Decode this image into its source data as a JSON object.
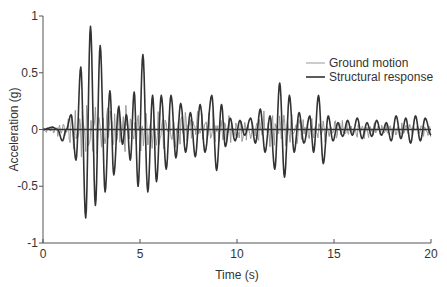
{
  "chart_data": {
    "type": "line",
    "title": "",
    "xlabel": "Time (s)",
    "ylabel": "Acceleration (g)",
    "xlim": [
      0,
      20
    ],
    "ylim": [
      -1,
      1
    ],
    "xticks": [
      0,
      5,
      10,
      15,
      20
    ],
    "xtick_labels": [
      "0",
      "5",
      "10",
      "15",
      "20"
    ],
    "yticks": [
      -1,
      -0.5,
      0,
      0.5,
      1
    ],
    "ytick_labels": [
      "-1",
      "-0.5",
      "0",
      "0.5",
      "1"
    ],
    "grid": false,
    "zero_line": true,
    "legend": {
      "position": "upper right",
      "entries": [
        {
          "label": "Ground motion",
          "color": "#999999",
          "width": 1
        },
        {
          "label": "Structural response",
          "color": "#333333",
          "width": 1.6
        }
      ]
    },
    "series": [
      {
        "name": "Structural response",
        "color": "#333333",
        "note": "peak/trough sequence (time s, acceleration g)",
        "x": [
          0,
          0.5,
          0.75,
          1.0,
          1.2,
          1.45,
          1.7,
          1.95,
          2.2,
          2.45,
          2.7,
          2.95,
          3.2,
          3.45,
          3.65,
          3.9,
          4.1,
          4.3,
          4.5,
          4.7,
          4.9,
          5.15,
          5.4,
          5.65,
          5.85,
          6.1,
          6.35,
          6.6,
          6.85,
          7.1,
          7.35,
          7.6,
          7.85,
          8.1,
          8.35,
          8.7,
          8.95,
          9.2,
          9.4,
          9.65,
          9.9,
          10.15,
          10.4,
          10.7,
          10.95,
          11.2,
          11.45,
          11.7,
          11.95,
          12.2,
          12.45,
          12.7,
          12.95,
          13.2,
          13.45,
          13.75,
          13.95,
          14.2,
          14.45,
          14.7,
          14.95,
          15.2,
          15.45,
          15.7,
          15.95,
          16.2,
          16.45,
          16.7,
          16.95,
          17.2,
          17.45,
          17.7,
          17.95,
          18.2,
          18.45,
          18.7,
          18.95,
          19.2,
          19.45,
          19.7,
          20.0
        ],
        "values": [
          0,
          0.02,
          0.0,
          -0.1,
          0.0,
          0.13,
          -0.27,
          0.55,
          -0.78,
          0.91,
          -0.67,
          0.74,
          -0.55,
          0.34,
          -0.4,
          0.2,
          -0.13,
          0.13,
          -0.27,
          0.33,
          -0.5,
          0.66,
          -0.55,
          0.3,
          -0.46,
          0.3,
          -0.35,
          0.3,
          -0.25,
          0.23,
          -0.2,
          0.15,
          -0.24,
          0.22,
          -0.2,
          0.3,
          -0.36,
          0.22,
          -0.15,
          0.1,
          -0.1,
          0.08,
          -0.05,
          0.1,
          -0.12,
          0.18,
          -0.2,
          0.12,
          -0.35,
          0.41,
          -0.42,
          0.3,
          -0.2,
          0.15,
          -0.12,
          0.12,
          -0.2,
          0.3,
          -0.3,
          0.12,
          -0.1,
          0.06,
          -0.06,
          0.08,
          -0.05,
          0.1,
          -0.08,
          0.06,
          -0.06,
          0.08,
          -0.05,
          0.06,
          -0.1,
          0.12,
          -0.08,
          0.1,
          -0.12,
          0.12,
          -0.1,
          0.1,
          -0.05
        ]
      },
      {
        "name": "Ground motion",
        "color": "#999999",
        "note": "high-frequency noisy record; envelope ~±0.05 for t<1s, up to ~±0.25 between 1.5–5s, ~±0.15 from 5–13s, ~±0.08 after 15s",
        "envelope": {
          "x": [
            0,
            1,
            1.5,
            2,
            3,
            4,
            5,
            7,
            9,
            11,
            12,
            13,
            15,
            17,
            20
          ],
          "values": [
            0.03,
            0.06,
            0.22,
            0.25,
            0.22,
            0.2,
            0.18,
            0.15,
            0.12,
            0.12,
            0.15,
            0.13,
            0.08,
            0.07,
            0.06
          ]
        }
      }
    ]
  }
}
